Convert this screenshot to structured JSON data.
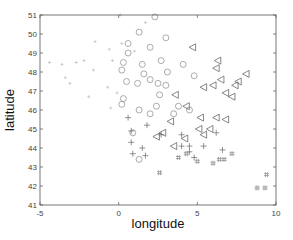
{
  "chart_data": {
    "type": "scatter",
    "title": "",
    "xlabel": "longitude",
    "ylabel": "latitude",
    "xlim": [
      -5,
      10
    ],
    "ylim": [
      41,
      51
    ],
    "xticks": [
      -5,
      0,
      5,
      10
    ],
    "yticks": [
      41,
      42,
      43,
      44,
      45,
      46,
      47,
      48,
      49,
      50,
      51
    ],
    "grid": false,
    "legend": null,
    "series": [
      {
        "name": "west (dot / light plus)",
        "marker": "point",
        "color": "#bbbbbb",
        "points": [
          [
            -4.4,
            48.5
          ],
          [
            -3.6,
            48.4
          ],
          [
            -2.7,
            48.5
          ],
          [
            -2.2,
            48.6
          ],
          [
            -1.5,
            49.6
          ],
          [
            -1.6,
            48.1
          ],
          [
            -3.4,
            47.7
          ],
          [
            -3.1,
            47.4
          ],
          [
            -0.6,
            49.2
          ],
          [
            -0.4,
            48.6
          ],
          [
            -0.7,
            47.2
          ],
          [
            -1.9,
            46.7
          ],
          [
            -0.5,
            46.1
          ],
          [
            -0.1,
            46.9
          ],
          [
            0.2,
            49.5
          ],
          [
            0.1,
            51.0
          ],
          [
            1.7,
            50.6
          ],
          [
            1.0,
            49.1
          ]
        ]
      },
      {
        "name": "center (circle)",
        "marker": "circle",
        "color": "#888888",
        "points": [
          [
            2.3,
            50.9
          ],
          [
            1.3,
            50.1
          ],
          [
            0.6,
            49.5
          ],
          [
            3.0,
            49.8
          ],
          [
            2.0,
            49.3
          ],
          [
            0.6,
            49.0
          ],
          [
            2.7,
            48.6
          ],
          [
            4.1,
            48.4
          ],
          [
            1.5,
            48.4
          ],
          [
            3.1,
            48.0
          ],
          [
            4.8,
            47.8
          ],
          [
            0.3,
            48.5
          ],
          [
            0.2,
            48.1
          ],
          [
            0.5,
            47.5
          ],
          [
            1.2,
            47.4
          ],
          [
            2.0,
            47.6
          ],
          [
            2.5,
            47.4
          ],
          [
            3.0,
            47.3
          ],
          [
            1.6,
            47.9
          ],
          [
            2.6,
            46.8
          ],
          [
            0.3,
            46.6
          ],
          [
            0.2,
            46.3
          ],
          [
            1.3,
            46.0
          ],
          [
            2.4,
            46.2
          ],
          [
            3.5,
            45.8
          ],
          [
            2.0,
            45.8
          ],
          [
            0.9,
            44.8
          ],
          [
            1.3,
            43.4
          ],
          [
            3.8,
            46.2
          ],
          [
            4.5,
            46.0
          ]
        ]
      },
      {
        "name": "east (triangle-left)",
        "marker": "triangle-left",
        "color": "#555555",
        "points": [
          [
            4.7,
            49.3
          ],
          [
            6.3,
            48.6
          ],
          [
            6.2,
            48.2
          ],
          [
            8.1,
            47.9
          ],
          [
            6.5,
            47.6
          ],
          [
            6.0,
            47.3
          ],
          [
            5.4,
            47.2
          ],
          [
            7.6,
            47.5
          ],
          [
            7.4,
            47.3
          ],
          [
            6.8,
            46.9
          ],
          [
            7.2,
            46.7
          ],
          [
            3.6,
            46.8
          ],
          [
            4.3,
            46.2
          ],
          [
            5.2,
            45.6
          ],
          [
            6.2,
            45.6
          ],
          [
            3.3,
            45.4
          ],
          [
            2.8,
            44.8
          ],
          [
            2.4,
            44.6
          ],
          [
            5.1,
            45.0
          ],
          [
            5.8,
            45.0
          ],
          [
            3.5,
            44.1
          ],
          [
            4.2,
            44.5
          ],
          [
            6.8,
            45.5
          ],
          [
            5.4,
            44.7
          ]
        ]
      },
      {
        "name": "south (plus)",
        "marker": "plus",
        "color": "#666666",
        "points": [
          [
            0.6,
            45.6
          ],
          [
            0.8,
            44.9
          ],
          [
            0.8,
            44.3
          ],
          [
            0.9,
            43.7
          ],
          [
            1.5,
            44.0
          ],
          [
            1.7,
            43.6
          ],
          [
            1.8,
            45.2
          ],
          [
            2.7,
            44.7
          ],
          [
            4.0,
            44.1
          ],
          [
            4.5,
            44.1
          ],
          [
            4.5,
            43.8
          ],
          [
            4.0,
            44.7
          ],
          [
            4.8,
            43.5
          ],
          [
            5.4,
            44.1
          ],
          [
            6.2,
            44.8
          ],
          [
            6.6,
            43.9
          ]
        ]
      },
      {
        "name": "south-east (hash)",
        "marker": "hash",
        "color": "#888888",
        "points": [
          [
            2.6,
            42.7
          ],
          [
            3.8,
            43.5
          ],
          [
            4.3,
            43.7
          ],
          [
            5.0,
            43.3
          ],
          [
            6.0,
            43.2
          ],
          [
            6.4,
            43.4
          ],
          [
            6.7,
            43.4
          ],
          [
            7.2,
            43.7
          ],
          [
            9.4,
            42.6
          ],
          [
            8.8,
            41.9
          ],
          [
            9.3,
            41.9
          ]
        ]
      }
    ]
  }
}
